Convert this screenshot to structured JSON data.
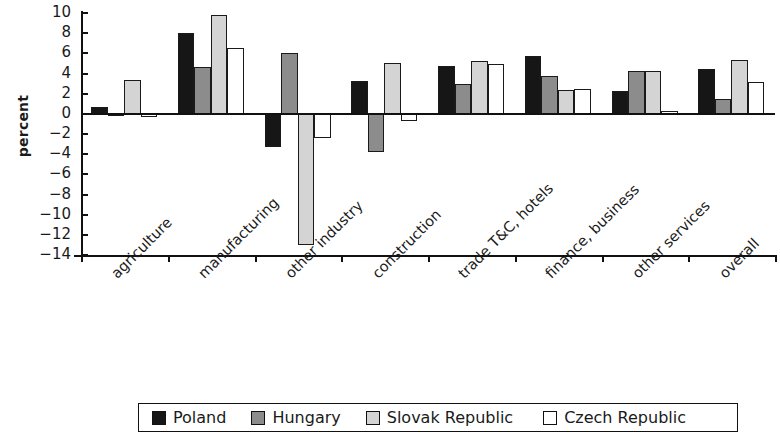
{
  "chart_data": {
    "type": "bar",
    "title": "",
    "subtitle": "",
    "xlabel": "",
    "ylabel": "percent",
    "ylim": [
      -14,
      10
    ],
    "yticks": [
      10,
      8,
      6,
      4,
      2,
      0,
      -2,
      -4,
      -6,
      -8,
      -10,
      -12,
      -14
    ],
    "ytick_labels": [
      "10",
      "8",
      "6",
      "4",
      "2",
      "0",
      "−2",
      "−4",
      "−6",
      "−8",
      "−10",
      "−12",
      "−14"
    ],
    "grid": false,
    "legend_position": "bottom",
    "categories": [
      "agriculture",
      "manufacturing",
      "other industry",
      "construction",
      "trade T&C, hotels",
      "finance, business",
      "other services",
      "overall"
    ],
    "series": [
      {
        "name": "Poland",
        "color": "#161616",
        "values": [
          0.7,
          8.0,
          -3.3,
          3.3,
          4.7,
          5.7,
          2.3,
          4.4
        ]
      },
      {
        "name": "Hungary",
        "color": "#8c8c8c",
        "values": [
          -0.2,
          4.6,
          6.0,
          -3.8,
          3.0,
          3.8,
          4.2,
          1.5
        ]
      },
      {
        "name": "Slovak Republic",
        "color": "#d4d4d4",
        "values": [
          3.4,
          9.8,
          -13.0,
          5.0,
          5.2,
          2.4,
          4.2,
          5.3
        ]
      },
      {
        "name": "Czech Republic",
        "color": "#ffffff",
        "values": [
          -0.3,
          6.5,
          -2.4,
          -0.7,
          4.9,
          2.5,
          0.2,
          3.2
        ]
      }
    ]
  },
  "legend": {
    "entries": [
      {
        "label": "Poland",
        "swatch": "black-filled-square"
      },
      {
        "label": "Hungary",
        "swatch": "dark-gray-filled-square"
      },
      {
        "label": "Slovak Republic",
        "swatch": "light-gray-filled-square"
      },
      {
        "label": "Czech Republic",
        "swatch": "white-empty-square"
      }
    ]
  }
}
